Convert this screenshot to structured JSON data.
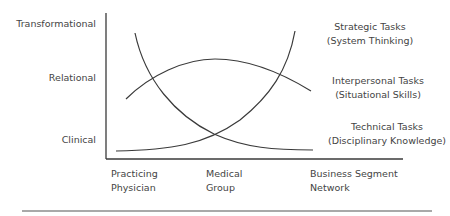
{
  "diagram": {
    "y_axis": {
      "levels": [
        "Transformational",
        "Relational",
        "Clinical"
      ]
    },
    "x_axis": {
      "categories": [
        {
          "line1": "Practicing",
          "line2": "Physician"
        },
        {
          "line1": "Medical",
          "line2": "Group"
        },
        {
          "line1": "Business Segment",
          "line2": "Network"
        }
      ]
    },
    "curves": [
      {
        "id": "strategic",
        "label": "Strategic Tasks",
        "sublabel": "(System Thinking)",
        "trend": "rising"
      },
      {
        "id": "interpersonal",
        "label": "Interpersonal Tasks",
        "sublabel": "(Situational Skills)",
        "trend": "arch"
      },
      {
        "id": "technical",
        "label": "Technical Tasks",
        "sublabel": "(Disciplinary Knowledge)",
        "trend": "falling"
      }
    ],
    "colors": {
      "line": "#3a3a3a",
      "text": "#444444"
    }
  }
}
